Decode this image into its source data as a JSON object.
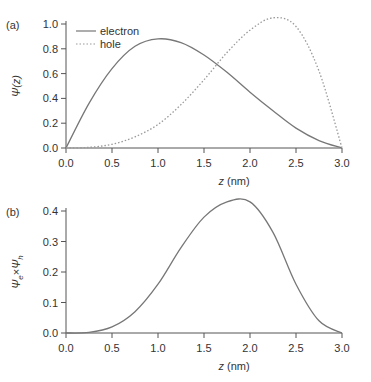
{
  "chart_data": [
    {
      "panel": "(a)",
      "type": "line",
      "title": "",
      "xlabel": "z (nm)",
      "ylabel": "Ψ(z)",
      "xlim": [
        0.0,
        3.0
      ],
      "ylim": [
        0.0,
        1.0
      ],
      "xticks": [
        "0.0",
        "0.5",
        "1.0",
        "1.5",
        "2.0",
        "2.5",
        "3.0"
      ],
      "yticks": [
        "0.0",
        "0.2",
        "0.4",
        "0.6",
        "0.8",
        "1.0"
      ],
      "grid": false,
      "legend_position": "top-left",
      "x": [
        0.0,
        0.25,
        0.5,
        0.75,
        1.0,
        1.25,
        1.5,
        1.75,
        2.0,
        2.25,
        2.5,
        2.75,
        3.0
      ],
      "series": [
        {
          "name": "electron",
          "style": "solid",
          "values": [
            0.0,
            0.36,
            0.64,
            0.82,
            0.88,
            0.85,
            0.75,
            0.61,
            0.45,
            0.3,
            0.16,
            0.06,
            0.0
          ]
        },
        {
          "name": "hole",
          "style": "dotted",
          "values": [
            0.0,
            0.005,
            0.03,
            0.09,
            0.19,
            0.35,
            0.55,
            0.77,
            0.95,
            1.05,
            0.98,
            0.62,
            0.0
          ]
        }
      ]
    },
    {
      "panel": "(b)",
      "type": "line",
      "title": "",
      "xlabel": "z (nm)",
      "ylabel": "Ψe×Ψh",
      "xlim": [
        0.0,
        3.0
      ],
      "ylim": [
        0.0,
        0.4
      ],
      "xticks": [
        "0.0",
        "0.5",
        "1.0",
        "1.5",
        "2.0",
        "2.5",
        "3.0"
      ],
      "yticks": [
        "0.0",
        "0.1",
        "0.2",
        "0.3",
        "0.4"
      ],
      "grid": false,
      "x": [
        0.0,
        0.25,
        0.5,
        0.75,
        1.0,
        1.25,
        1.5,
        1.75,
        2.0,
        2.25,
        2.5,
        2.75,
        3.0
      ],
      "series": [
        {
          "name": "Ψe×Ψh",
          "style": "solid",
          "values": [
            0.0,
            0.002,
            0.02,
            0.07,
            0.16,
            0.28,
            0.38,
            0.43,
            0.43,
            0.33,
            0.16,
            0.04,
            0.0
          ]
        }
      ]
    }
  ]
}
